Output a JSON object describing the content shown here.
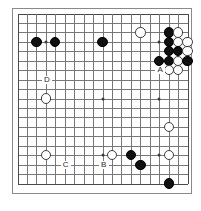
{
  "diagram": {
    "type": "go-board",
    "board_size": 19,
    "frame_color": "#8a8a8a",
    "line_color": "#77777a",
    "black_color": "#101010",
    "white_color": "#ffffff"
  },
  "geometry": {
    "origin_x": 17.5,
    "origin_y": 13.5,
    "spacing_x": 9.45,
    "spacing_y": 9.45,
    "stone_diameter": 10.4
  },
  "star_points": [
    {
      "col": 3,
      "row": 3
    },
    {
      "col": 9,
      "row": 3
    },
    {
      "col": 15,
      "row": 3
    },
    {
      "col": 3,
      "row": 9
    },
    {
      "col": 9,
      "row": 9
    },
    {
      "col": 15,
      "row": 9
    },
    {
      "col": 3,
      "row": 15
    },
    {
      "col": 9,
      "row": 15
    },
    {
      "col": 15,
      "row": 15
    }
  ],
  "stones": [
    {
      "color": "black",
      "col": 2,
      "row": 3
    },
    {
      "color": "black",
      "col": 4,
      "row": 3
    },
    {
      "color": "black",
      "col": 9,
      "row": 3
    },
    {
      "color": "white",
      "col": 13,
      "row": 2
    },
    {
      "color": "black",
      "col": 16,
      "row": 2
    },
    {
      "color": "white",
      "col": 17,
      "row": 2
    },
    {
      "color": "black",
      "col": 16,
      "row": 3
    },
    {
      "color": "white",
      "col": 17,
      "row": 3
    },
    {
      "color": "white",
      "col": 18,
      "row": 3
    },
    {
      "color": "black",
      "col": 16,
      "row": 4
    },
    {
      "color": "black",
      "col": 17,
      "row": 4
    },
    {
      "color": "white",
      "col": 18,
      "row": 4
    },
    {
      "color": "black",
      "col": 15,
      "row": 5
    },
    {
      "color": "black",
      "col": 16,
      "row": 5
    },
    {
      "color": "white",
      "col": 17,
      "row": 5
    },
    {
      "color": "black",
      "col": 18,
      "row": 5
    },
    {
      "color": "white",
      "col": 16,
      "row": 6
    },
    {
      "color": "white",
      "col": 17,
      "row": 6
    },
    {
      "color": "white",
      "col": 3,
      "row": 9
    },
    {
      "color": "white",
      "col": 16,
      "row": 12
    },
    {
      "color": "white",
      "col": 3,
      "row": 15
    },
    {
      "color": "white",
      "col": 10,
      "row": 15
    },
    {
      "color": "black",
      "col": 12,
      "row": 15
    },
    {
      "color": "white",
      "col": 16,
      "row": 15
    },
    {
      "color": "black",
      "col": 13,
      "row": 16
    },
    {
      "color": "black",
      "col": 16,
      "row": 18
    }
  ],
  "labels": [
    {
      "text": "A",
      "col": 15,
      "row": 6
    },
    {
      "text": "B",
      "col": 9,
      "row": 16
    },
    {
      "text": "C",
      "col": 5,
      "row": 16
    },
    {
      "text": "D",
      "col": 3,
      "row": 7
    }
  ]
}
